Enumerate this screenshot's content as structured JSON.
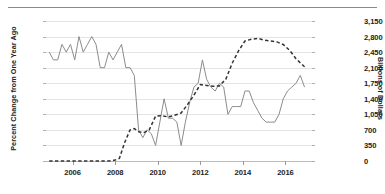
{
  "chart_data": {
    "type": "line",
    "title": "",
    "xlabel": "",
    "ylabel": "Percent Change from One Year Ago",
    "y2label": "Billions of Dollars",
    "grid": true,
    "legend": "none",
    "xlim": [
      2004.75,
      2017.25
    ],
    "ylim": [
      0.8,
      2.6
    ],
    "y2lim": [
      0,
      3150
    ],
    "xticks": [
      2006,
      2008,
      2010,
      2012,
      2014,
      2016
    ],
    "yticks": [
      0.8,
      1.0,
      1.2,
      1.4,
      1.6,
      1.8,
      2.0,
      2.2,
      2.4,
      2.6
    ],
    "ytick_labels": [
      "0.8",
      "1.0",
      "1.2",
      "1.4",
      "1.6",
      "1.8",
      "2.0",
      "2.2",
      "2.4",
      "2.6"
    ],
    "y2ticks": [
      0,
      350,
      700,
      1050,
      1400,
      1750,
      2100,
      2450,
      2800,
      3150
    ],
    "y2tick_labels": [
      "0",
      "350",
      "700",
      "1,050",
      "1,400",
      "1,750",
      "2,100",
      "2,450",
      "2,800",
      "3,150"
    ],
    "series": [
      {
        "name": "Percent Change from One Year Ago",
        "axis": "left",
        "style": "solid",
        "color": "#8c8c8c",
        "x": [
          2004.9,
          2005.1,
          2005.3,
          2005.5,
          2005.7,
          2005.9,
          2006.1,
          2006.3,
          2006.5,
          2006.7,
          2006.9,
          2007.1,
          2007.3,
          2007.5,
          2007.7,
          2007.9,
          2008.1,
          2008.3,
          2008.5,
          2008.7,
          2008.9,
          2009.1,
          2009.3,
          2009.5,
          2009.7,
          2009.9,
          2010.1,
          2010.3,
          2010.5,
          2010.7,
          2010.9,
          2011.1,
          2011.3,
          2011.5,
          2011.7,
          2011.9,
          2012.1,
          2012.3,
          2012.5,
          2012.7,
          2012.9,
          2013.1,
          2013.3,
          2013.5,
          2013.7,
          2013.9,
          2014.1,
          2014.3,
          2014.5,
          2014.7,
          2014.9,
          2015.1,
          2015.3,
          2015.5,
          2015.7,
          2015.9,
          2016.1,
          2016.3,
          2016.5,
          2016.7,
          2016.9
        ],
        "values": [
          2.2,
          2.1,
          2.1,
          2.3,
          2.2,
          2.3,
          2.1,
          2.4,
          2.2,
          2.3,
          2.4,
          2.3,
          2.0,
          2.0,
          2.2,
          2.1,
          2.2,
          2.3,
          2.0,
          2.0,
          1.9,
          1.2,
          1.1,
          1.2,
          1.15,
          1.0,
          1.3,
          1.6,
          1.35,
          1.35,
          1.3,
          1.0,
          1.3,
          1.55,
          1.75,
          1.8,
          2.1,
          1.85,
          1.75,
          1.7,
          1.8,
          1.75,
          1.4,
          1.5,
          1.5,
          1.5,
          1.7,
          1.7,
          1.55,
          1.45,
          1.35,
          1.3,
          1.3,
          1.3,
          1.4,
          1.6,
          1.7,
          1.75,
          1.8,
          1.9,
          1.75
        ]
      },
      {
        "name": "Billions of Dollars",
        "axis": "right",
        "style": "dashed",
        "color": "#333333",
        "x": [
          2004.9,
          2005.3,
          2005.7,
          2006.1,
          2006.5,
          2006.9,
          2007.3,
          2007.7,
          2008.0,
          2008.2,
          2008.45,
          2008.7,
          2008.9,
          2009.1,
          2009.35,
          2009.6,
          2009.9,
          2010.2,
          2010.5,
          2010.8,
          2011.1,
          2011.4,
          2011.7,
          2012.0,
          2012.3,
          2012.6,
          2012.9,
          2013.2,
          2013.5,
          2013.8,
          2014.1,
          2014.4,
          2014.7,
          2015.0,
          2015.3,
          2015.6,
          2015.9,
          2016.2,
          2016.5,
          2016.9
        ],
        "values": [
          0,
          0,
          0,
          0,
          0,
          0,
          0,
          0,
          20,
          60,
          420,
          700,
          730,
          660,
          640,
          700,
          1010,
          1020,
          990,
          1030,
          1080,
          1270,
          1480,
          1720,
          1700,
          1680,
          1690,
          1840,
          2200,
          2480,
          2700,
          2740,
          2760,
          2720,
          2700,
          2680,
          2620,
          2490,
          2300,
          2120
        ]
      }
    ]
  }
}
